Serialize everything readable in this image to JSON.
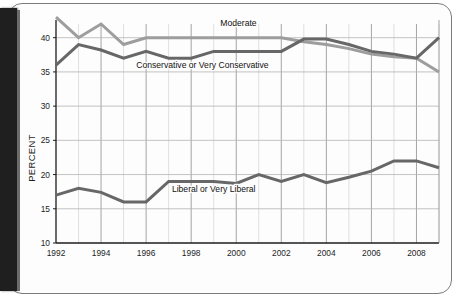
{
  "page": {
    "binding_color": "#201f1f",
    "sheet_background": "#fdfdfd",
    "sheet_border_color": "#7c7c7c"
  },
  "chart_data": {
    "type": "line",
    "title": "",
    "subtitle": "",
    "xlabel": "",
    "ylabel": "PERCENT",
    "xlim": [
      1992,
      2009
    ],
    "ylim": [
      10,
      42
    ],
    "ytick_labels": [
      "10",
      "15",
      "20",
      "25",
      "30",
      "35",
      "40"
    ],
    "yticks": [
      10,
      15,
      20,
      25,
      30,
      35,
      40
    ],
    "xtick_labels": [
      "1992",
      "1994",
      "1996",
      "1998",
      "2000",
      "2002",
      "2004",
      "2006",
      "2008"
    ],
    "xticks": [
      1992,
      1994,
      1996,
      1998,
      2000,
      2002,
      2004,
      2006,
      2008
    ],
    "grid": true,
    "grid_minor_years": true,
    "legend": "inline-labels",
    "x": [
      1992,
      1993,
      1994,
      1995,
      1996,
      1997,
      1998,
      1999,
      2000,
      2001,
      2002,
      2003,
      2004,
      2005,
      2006,
      2007,
      2008,
      2009
    ],
    "series": [
      {
        "name": "Moderate",
        "color": "#9d9d9d",
        "label": "Moderate",
        "label_x": 2000.1,
        "label_y": 41.7,
        "values": [
          43.0,
          40.0,
          42.0,
          39.0,
          40.0,
          40.0,
          40.0,
          40.0,
          40.0,
          40.0,
          40.0,
          39.4,
          39.0,
          38.4,
          37.6,
          37.2,
          37.0,
          35.0
        ]
      },
      {
        "name": "Conservative or Very Conservative",
        "color": "#676767",
        "label": "Conservative or Very Conservative",
        "label_x": 1998.5,
        "label_y": 35.6,
        "values": [
          36.0,
          39.0,
          38.2,
          37.0,
          38.0,
          37.0,
          37.0,
          38.0,
          38.0,
          38.0,
          38.0,
          39.8,
          39.8,
          39.0,
          38.0,
          37.6,
          37.0,
          40.0
        ]
      },
      {
        "name": "Liberal or Very Liberal",
        "color": "#676767",
        "label": "Liberal or Very Liberal",
        "label_x": 1999.0,
        "label_y": 17.4,
        "values": [
          17.0,
          18.0,
          17.4,
          16.0,
          16.0,
          19.0,
          19.0,
          19.0,
          18.7,
          20.0,
          19.0,
          20.0,
          18.8,
          19.6,
          20.5,
          22.0,
          22.0,
          21.0
        ]
      }
    ]
  }
}
